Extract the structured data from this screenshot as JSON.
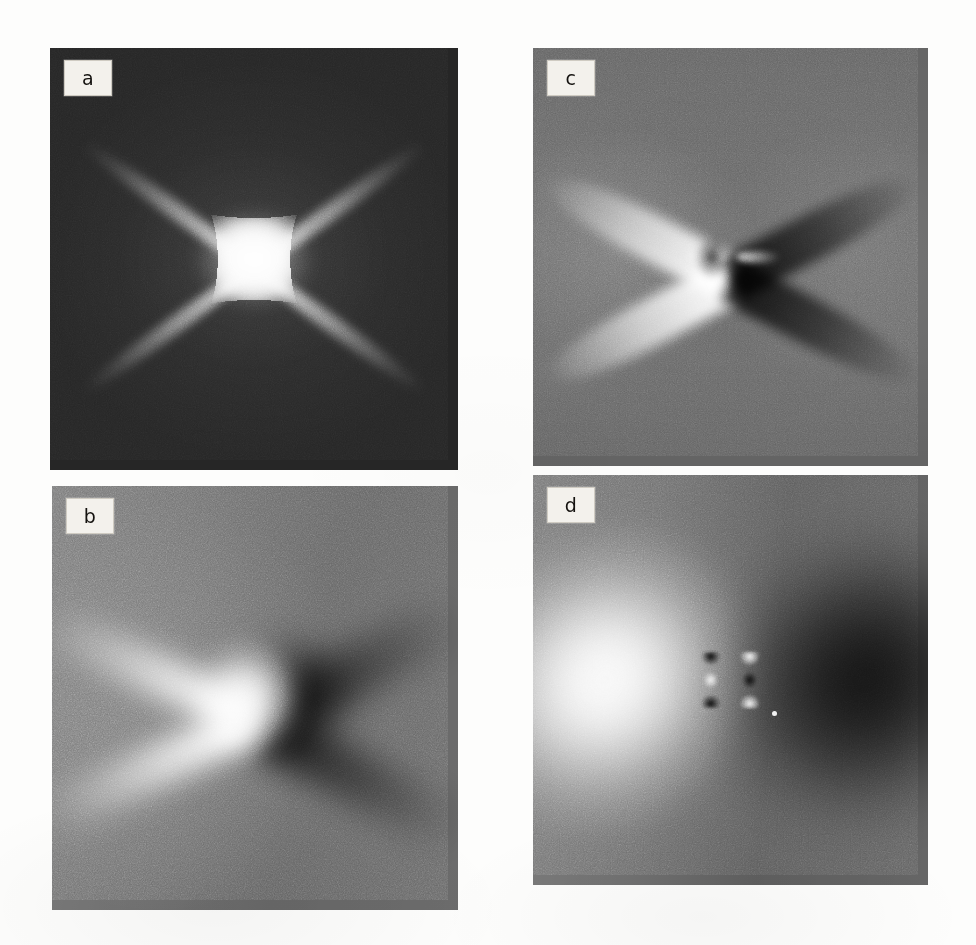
{
  "figure": {
    "layout": "2x2 panel grid",
    "background_color": "#fdfdfc",
    "panels": [
      {
        "id": "a",
        "label": "a",
        "position": "top-left",
        "background_color": "#262626",
        "description": "dark-field diffraction contrast image with bright astroid core and four diagonal spikes"
      },
      {
        "id": "b",
        "label": "b",
        "position": "bottom-left",
        "background_color": "#6e6e6e",
        "description": "mid-gray field with bright right-pointing wedge at left and dark opening wedge at right"
      },
      {
        "id": "c",
        "label": "c",
        "position": "top-right",
        "background_color": "#6b6b6b",
        "description": "four-lobed butterfly contrast: two bright blades to the left, two dark blades to the right"
      },
      {
        "id": "d",
        "label": "d",
        "position": "bottom-right",
        "background_color": "#6a6a6a",
        "description": "bright diamond lobe at left, dark diamond lobe at right, paired bowtie detail at centre"
      }
    ]
  },
  "chip": {
    "background_color": "#f3f1ec",
    "border_color": "#cfcbc2",
    "text_color": "#14120f"
  }
}
